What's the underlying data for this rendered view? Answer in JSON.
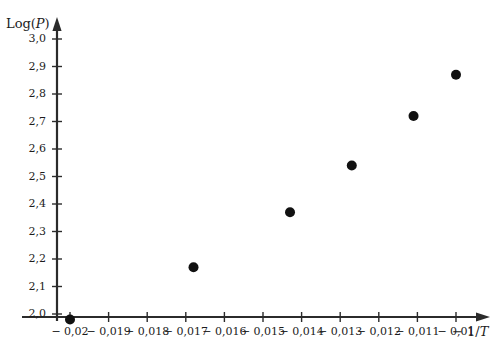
{
  "chart_data": {
    "type": "scatter",
    "title": "",
    "xlabel": "− 1/T",
    "ylabel": "Log(P)",
    "grid": false,
    "legend": null,
    "xlim": [
      -0.0205,
      -0.00885
    ],
    "ylim": [
      1.95,
      3.05
    ],
    "x_tick_labels": [
      "− 0,02",
      "− 0,019",
      "− 0,018",
      "− 0,017",
      "− 0,016",
      "− 0,015",
      "− 0,014",
      "− 0,013",
      "− 0,012",
      "− 0,011",
      "− 0,01"
    ],
    "x_tick_values": [
      -0.02,
      -0.019,
      -0.018,
      -0.017,
      -0.016,
      -0.015,
      -0.014,
      -0.013,
      -0.012,
      -0.011,
      -0.01
    ],
    "y_tick_labels": [
      "2,0",
      "2,1",
      "2,2",
      "2,3",
      "2,4",
      "2,5",
      "2,6",
      "2,7",
      "2,8",
      "2,9",
      "3,0"
    ],
    "y_tick_values": [
      2.0,
      2.1,
      2.2,
      2.3,
      2.4,
      2.5,
      2.6,
      2.7,
      2.8,
      2.9,
      3.0
    ],
    "x": [
      -0.02,
      -0.0168,
      -0.0143,
      -0.0127,
      -0.0111,
      -0.01
    ],
    "y": [
      1.98,
      2.17,
      2.37,
      2.54,
      2.72,
      2.87
    ],
    "points": [
      {
        "x": -0.02,
        "y": 1.98
      },
      {
        "x": -0.0168,
        "y": 2.17
      },
      {
        "x": -0.0143,
        "y": 2.37
      },
      {
        "x": -0.0127,
        "y": 2.54
      },
      {
        "x": -0.0111,
        "y": 2.72
      },
      {
        "x": -0.01,
        "y": 2.87
      }
    ],
    "marker": {
      "shape": "circle",
      "color": "#111111",
      "size": 5
    }
  },
  "axes": {
    "y_axis_label_main": "Log(",
    "y_axis_label_var": "P",
    "y_axis_label_close": ")",
    "x_axis_label_prefix": "− 1/",
    "x_axis_label_var": "T",
    "axis_color": "#2b2b2b"
  }
}
